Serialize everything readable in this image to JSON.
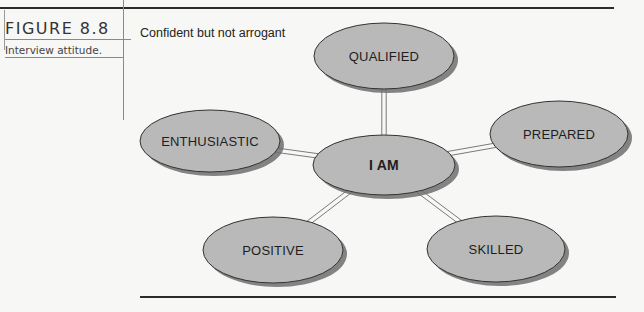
{
  "figure": {
    "number": "FIGURE 8.8",
    "caption": "Interview attitude.",
    "title": "Confident but not arrogant"
  },
  "diagram": {
    "fill_color": "#b9b9b9",
    "stroke_color": "#333333",
    "shadow_color": "#6e6e6e",
    "center": {
      "label": "I AM",
      "cx": 384,
      "cy": 165,
      "rx": 71,
      "ry": 30
    },
    "nodes": [
      {
        "label": "QUALIFIED",
        "cx": 384,
        "cy": 56,
        "rx": 70,
        "ry": 33
      },
      {
        "label": "PREPARED",
        "cx": 559,
        "cy": 134,
        "rx": 69,
        "ry": 33
      },
      {
        "label": "SKILLED",
        "cx": 496,
        "cy": 249,
        "rx": 69,
        "ry": 33
      },
      {
        "label": "POSITIVE",
        "cx": 273,
        "cy": 250,
        "rx": 70,
        "ry": 33
      },
      {
        "label": "ENTHUSIASTIC",
        "cx": 210,
        "cy": 141,
        "rx": 70,
        "ry": 31
      }
    ]
  }
}
